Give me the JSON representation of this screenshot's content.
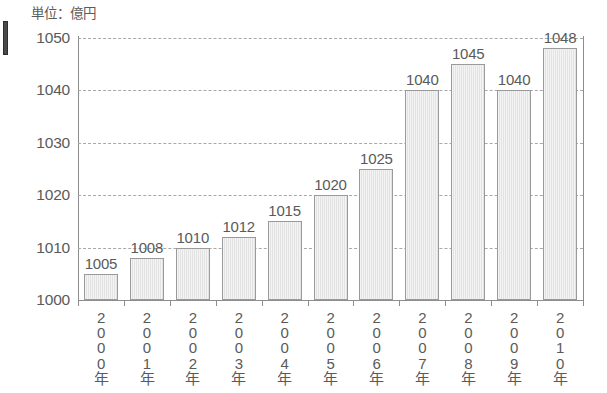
{
  "unit_note": "単位：億円",
  "chart_data": {
    "type": "bar",
    "title": "",
    "subtitle": "",
    "xlabel": "",
    "ylabel": "億円",
    "unit_label": "単位：億円",
    "categories": [
      "2000年",
      "2001年",
      "2002年",
      "2003年",
      "2004年",
      "2005年",
      "2006年",
      "2007年",
      "2008年",
      "2009年",
      "2010年"
    ],
    "values": [
      1005,
      1008,
      1010,
      1012,
      1015,
      1020,
      1025,
      1040,
      1045,
      1040,
      1048
    ],
    "data_labels": [
      "1005",
      "1008",
      "1010",
      "1012",
      "1015",
      "1020",
      "1025",
      "1040",
      "1045",
      "1040",
      "1048"
    ],
    "ylim": [
      1000,
      1050
    ],
    "yticks": [
      1000,
      1010,
      1020,
      1030,
      1040,
      1050
    ],
    "ytick_labels": [
      "1000",
      "1010",
      "1020",
      "1030",
      "1040",
      "1050"
    ],
    "grid": true,
    "grid_style": "dashed",
    "legend": null,
    "legend_position": "none",
    "bar_fill_color": "#e3e3e3",
    "bar_border_color": "#9a9a9a",
    "axis_color": "#8d8d8d",
    "text_color": "#5a5a5a",
    "background_color": "#ffffff"
  }
}
